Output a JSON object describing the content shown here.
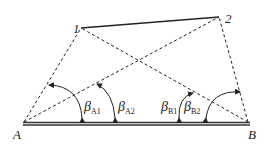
{
  "diagram": {
    "type": "survey-triangulation",
    "points": {
      "A": {
        "label": "A",
        "x": 24,
        "y": 123
      },
      "B": {
        "label": "B",
        "x": 248,
        "y": 123
      },
      "p1": {
        "label": "1",
        "x": 81,
        "y": 28
      },
      "p2": {
        "label": "2",
        "x": 219,
        "y": 17
      }
    },
    "angles": [
      {
        "id": "A1",
        "symbol": "β",
        "subscript": "A1"
      },
      {
        "id": "A2",
        "symbol": "β",
        "subscript": "A2"
      },
      {
        "id": "B1",
        "symbol": "β",
        "subscript": "B1"
      },
      {
        "id": "B2",
        "symbol": "β",
        "subscript": "B2"
      }
    ],
    "lines": {
      "solid": [
        "1-2",
        "A-B (baseline, double)"
      ],
      "dashed": [
        "A-1",
        "A-2",
        "B-1",
        "B-2"
      ]
    },
    "colors": {
      "line": "#222222",
      "background": "#ffffff"
    }
  }
}
